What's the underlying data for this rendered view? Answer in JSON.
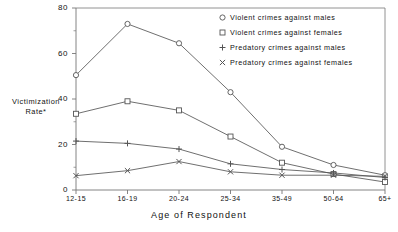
{
  "chart_data": {
    "type": "line",
    "title": "",
    "xlabel": "Age of Respondent",
    "ylabel": "Victimization Rate*",
    "ylabel_line1": "Victimization",
    "ylabel_line2": "Rate*",
    "categories": [
      "12-15",
      "16-19",
      "20-24",
      "25-34",
      "35-49",
      "50-64",
      "65+"
    ],
    "ylim": [
      0,
      80
    ],
    "yticks": [
      0,
      20,
      40,
      60,
      80
    ],
    "grid": false,
    "legend_position": "top-right",
    "series": [
      {
        "name": "Violent crimes against males",
        "marker": "circle",
        "values": [
          50.5,
          73.0,
          64.5,
          43.0,
          19.0,
          11.0,
          6.5
        ]
      },
      {
        "name": "Violent crimes against females",
        "marker": "square",
        "values": [
          33.5,
          39.0,
          35.0,
          23.5,
          12.0,
          7.0,
          3.5
        ]
      },
      {
        "name": "Predatory crimes against males",
        "marker": "plus",
        "values": [
          21.5,
          20.5,
          18.0,
          11.5,
          9.0,
          7.5,
          5.5
        ]
      },
      {
        "name": "Predatory crimes against females",
        "marker": "cross",
        "values": [
          6.3,
          8.5,
          12.5,
          8.0,
          6.5,
          6.5,
          6.0
        ]
      }
    ]
  },
  "legend": {
    "items": [
      {
        "marker": "circle",
        "label": "Violent crimes against males"
      },
      {
        "marker": "square",
        "label": "Violent crimes against females"
      },
      {
        "marker": "plus",
        "label": "Predatory crimes against males"
      },
      {
        "marker": "cross",
        "label": "Predatory crimes against females"
      }
    ]
  },
  "colors": {
    "line": "#555555",
    "axis": "#777777",
    "text": "#111111",
    "background": "#ffffff"
  }
}
